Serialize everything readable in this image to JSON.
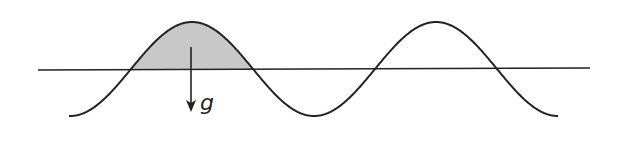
{
  "diagram": {
    "title": "",
    "colors": {
      "stroke": "#222222",
      "fill": "#c8c8c8",
      "background": "#ffffff"
    },
    "baseline": {
      "x1": 38,
      "y1": 70,
      "x2": 590,
      "y2": 68
    },
    "wave": {
      "x_start": 69,
      "x_end": 558,
      "center_y": 69,
      "amplitude": 47,
      "wavelength": 244,
      "phase_peak_x": 192,
      "crossings_x": [
        128,
        252,
        374,
        497
      ],
      "peaks": [
        {
          "x": 192,
          "y": 22
        },
        {
          "x": 436,
          "y": 22
        }
      ],
      "troughs": [
        {
          "x": 69,
          "y": 117
        },
        {
          "x": 315,
          "y": 116
        },
        {
          "x": 558,
          "y": 116
        }
      ]
    },
    "shaded_region": {
      "x_from": 128,
      "x_to": 252,
      "description": "crest above baseline"
    },
    "arrow": {
      "x": 191,
      "y_start": 47,
      "y_end": 112,
      "direction": "down"
    },
    "label": {
      "text": "g",
      "x": 200,
      "y": 110
    }
  }
}
